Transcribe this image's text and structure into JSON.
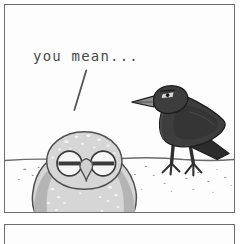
{
  "comic": {
    "title": "you mean...",
    "panel": {
      "border_color": "#6e6e6e",
      "background_color": "#fdfdfd"
    },
    "dialogue": {
      "text": "you mean...",
      "color": "#4a4a4a",
      "tail": {
        "shape": "diagonal-stroke",
        "color": "#555555"
      }
    },
    "scene": {
      "horizon": {
        "label": "ground-horizon-line",
        "color": "#6b6b6b",
        "y": 160
      },
      "ground_speckles": {
        "label": "ground-speckles",
        "color": "#9a9a9a",
        "count": 22
      }
    },
    "characters": [
      {
        "id": "owl",
        "name": "owl",
        "position": "foreground-left",
        "expression": "half-lidded-bored",
        "body_color": "#d6d6d6",
        "shade_color": "#b4b4b4",
        "outline_color": "#4f4f4f",
        "speckle_color": "#f3f3f3",
        "beak_color": "#d0d0d0",
        "eye_fill": "#f6f6f6",
        "eye_lid_color": "#3a3a3a"
      },
      {
        "id": "crow",
        "name": "crow",
        "position": "background-right",
        "facing": "left",
        "expression": "stern",
        "body_color": "#3d3d3d",
        "shade_color": "#2c2c2c",
        "highlight_color": "#565656",
        "outline_color": "#1d1d1d",
        "beak_color": "#8e8e8e",
        "eye_color": "#d8d8d8",
        "leg_color": "#2f2f2f"
      }
    ]
  }
}
